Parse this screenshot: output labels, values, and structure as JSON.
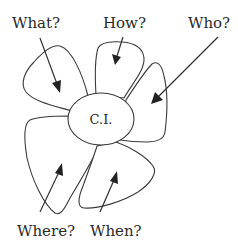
{
  "diagram": {
    "type": "flower / petal concept diagram",
    "center": {
      "label": "C.I."
    },
    "petals": [
      {
        "id": "what",
        "label": "What?"
      },
      {
        "id": "how",
        "label": "How?"
      },
      {
        "id": "who",
        "label": "Who?"
      },
      {
        "id": "where",
        "label": "Where?"
      },
      {
        "id": "when",
        "label": "When?"
      }
    ],
    "colors": {
      "stroke": "#3a3a3a",
      "text": "#2a2a2a",
      "background": "#ffffff"
    }
  }
}
